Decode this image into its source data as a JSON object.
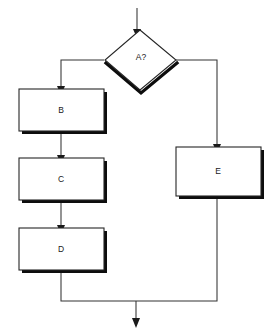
{
  "diagram": {
    "kind": "flowchart",
    "background_color": "#ffffff",
    "line_color": "#333333",
    "node_stroke_color": "#262626",
    "node_fill_color": "#ffffff",
    "shadow_color": "#0d0d0d",
    "text_color": "#1a1a1a",
    "nodes": [
      {
        "id": "A",
        "label": "A?",
        "shape": "diamond",
        "role": "decision",
        "x": 105,
        "y": 30,
        "width": 70,
        "height": 60,
        "label_x": 141,
        "label_y": 57
      },
      {
        "id": "B",
        "label": "B",
        "shape": "rectangle",
        "role": "process",
        "x": 19,
        "y": 89,
        "width": 85,
        "height": 42,
        "label_x": 61,
        "label_y": 110
      },
      {
        "id": "C",
        "label": "C",
        "shape": "rectangle",
        "role": "process",
        "x": 19,
        "y": 158,
        "width": 85,
        "height": 42,
        "label_x": 61,
        "label_y": 179
      },
      {
        "id": "D",
        "label": "D",
        "shape": "rectangle",
        "role": "process",
        "x": 19,
        "y": 228,
        "width": 85,
        "height": 42,
        "label_x": 61,
        "label_y": 249
      },
      {
        "id": "E",
        "label": "E",
        "shape": "rectangle",
        "role": "process",
        "x": 176,
        "y": 147,
        "width": 85,
        "height": 49,
        "label_x": 218,
        "label_y": 171
      }
    ],
    "edges": [
      {
        "id": "entry-to-A",
        "from": "start",
        "to": "A",
        "label": "",
        "path": "M 137 8 L 137 29",
        "arrow": "down",
        "arrow_x": 137,
        "arrow_y": 31
      },
      {
        "id": "A-to-B",
        "from": "A",
        "to": "B",
        "label": "",
        "path": "M 104 60 L 61 60 L 61 86",
        "arrow": "down",
        "arrow_x": 61,
        "arrow_y": 88
      },
      {
        "id": "A-to-E",
        "from": "A",
        "to": "E",
        "label": "",
        "path": "M 176 60 L 217 60 L 217 144",
        "arrow": "down",
        "arrow_x": 217,
        "arrow_y": 146
      },
      {
        "id": "B-to-C",
        "from": "B",
        "to": "C",
        "label": "",
        "path": "M 61 131 L 61 155",
        "arrow": "down",
        "arrow_x": 61,
        "arrow_y": 157
      },
      {
        "id": "C-to-D",
        "from": "C",
        "to": "D",
        "label": "",
        "path": "M 61 200 L 61 225",
        "arrow": "down",
        "arrow_x": 61,
        "arrow_y": 227
      },
      {
        "id": "D-to-merge",
        "from": "D",
        "to": "merge",
        "label": "",
        "path": "M 61 270 L 61 301 L 136 301",
        "arrow": "none",
        "arrow_x": 0,
        "arrow_y": 0
      },
      {
        "id": "E-to-merge",
        "from": "E",
        "to": "merge",
        "label": "",
        "path": "M 217 196 L 217 301 L 136 301",
        "arrow": "none",
        "arrow_x": 0,
        "arrow_y": 0
      },
      {
        "id": "merge-to-exit",
        "from": "merge",
        "to": "end",
        "label": "",
        "path": "M 136 301 L 136 322",
        "arrow": "down",
        "arrow_x": 136,
        "arrow_y": 326
      }
    ]
  }
}
